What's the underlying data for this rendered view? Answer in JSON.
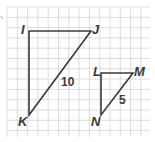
{
  "figure": {
    "grid": {
      "x0": 7,
      "y0": 7,
      "x1": 150,
      "y1": 137,
      "cell": 10.3,
      "line_color": "#d4d4d4",
      "border_color": "#c8c8c8"
    },
    "stroke_color": "#3a3a3a",
    "triangles": [
      {
        "name": "IJK",
        "vertices": [
          {
            "label": "I",
            "x": 29,
            "y": 31
          },
          {
            "label": "J",
            "x": 91,
            "y": 31
          },
          {
            "label": "K",
            "x": 29,
            "y": 115
          }
        ],
        "side_label": {
          "text": "10",
          "side": "JK"
        }
      },
      {
        "name": "LMN",
        "vertices": [
          {
            "label": "L",
            "x": 101,
            "y": 73
          },
          {
            "label": "M",
            "x": 133,
            "y": 73
          },
          {
            "label": "N",
            "x": 101,
            "y": 115
          }
        ],
        "side_label": {
          "text": "5",
          "side": "MN"
        }
      }
    ],
    "labels": {
      "I": "I",
      "J": "J",
      "K": "K",
      "L": "L",
      "M": "M",
      "N": "N",
      "side_JK": "10",
      "side_MN": "5"
    }
  }
}
